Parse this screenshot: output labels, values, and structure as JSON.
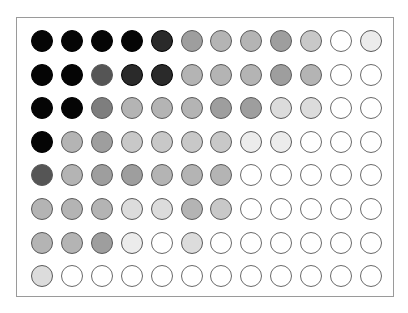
{
  "figure": {
    "rows": 8,
    "cols": 12,
    "scale": {
      "0": "#ffffff",
      "1": "#ececec",
      "2": "#dcdcdc",
      "3": "#c8c8c8",
      "4": "#b4b4b4",
      "5": "#9e9e9e",
      "6": "#7e7e7e",
      "7": "#555555",
      "8": "#2a2a2a",
      "9": "#050505"
    },
    "levels": [
      [
        9,
        9,
        9,
        9,
        8,
        5,
        4,
        4,
        5,
        3,
        0,
        1
      ],
      [
        9,
        9,
        7,
        8,
        8,
        4,
        4,
        4,
        5,
        4,
        0,
        0
      ],
      [
        9,
        9,
        6,
        4,
        4,
        4,
        5,
        5,
        2,
        2,
        0,
        0
      ],
      [
        9,
        4,
        5,
        3,
        3,
        3,
        3,
        1,
        1,
        0,
        0,
        0
      ],
      [
        7,
        4,
        5,
        5,
        4,
        4,
        4,
        0,
        0,
        0,
        0,
        0
      ],
      [
        4,
        4,
        4,
        2,
        2,
        4,
        3,
        0,
        0,
        0,
        0,
        0
      ],
      [
        4,
        4,
        5,
        1,
        0,
        2,
        0,
        0,
        0,
        0,
        0,
        0
      ],
      [
        2,
        0,
        0,
        0,
        0,
        0,
        0,
        0,
        0,
        0,
        0,
        0
      ]
    ]
  }
}
